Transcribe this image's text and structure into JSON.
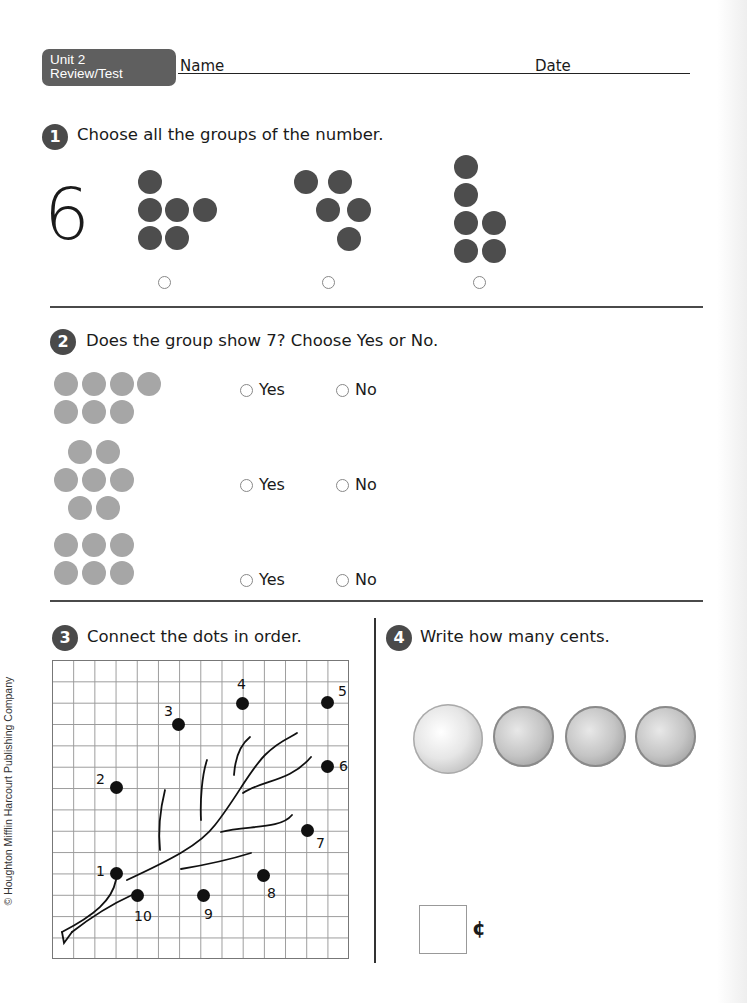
{
  "header": {
    "badge_line1": "Unit 2",
    "badge_line2": "Review/Test",
    "name_label": "Name",
    "date_label": "Date"
  },
  "q1": {
    "number": "1",
    "prompt": "Choose all the groups of the number.",
    "target_number": "6",
    "groups": [
      {
        "dot_count": 6,
        "selected": false
      },
      {
        "dot_count": 5,
        "selected": false
      },
      {
        "dot_count": 6,
        "selected": false
      }
    ]
  },
  "q2": {
    "number": "2",
    "prompt": "Does the group show 7? Choose Yes or No.",
    "yes_label": "Yes",
    "no_label": "No",
    "rows": [
      {
        "dot_count": 7,
        "answer": null
      },
      {
        "dot_count": 7,
        "answer": null
      },
      {
        "dot_count": 6,
        "answer": null
      }
    ]
  },
  "q3": {
    "number": "3",
    "prompt": "Connect the dots in order.",
    "dots": [
      {
        "label": "1"
      },
      {
        "label": "2"
      },
      {
        "label": "3"
      },
      {
        "label": "4"
      },
      {
        "label": "5"
      },
      {
        "label": "6"
      },
      {
        "label": "7"
      },
      {
        "label": "8"
      },
      {
        "label": "9"
      },
      {
        "label": "10"
      }
    ]
  },
  "q4": {
    "number": "4",
    "prompt": "Write how many cents.",
    "coins": [
      {
        "type": "nickel",
        "icon": "nickel-coin-icon"
      },
      {
        "type": "penny",
        "icon": "penny-coin-icon"
      },
      {
        "type": "penny",
        "icon": "penny-coin-icon"
      },
      {
        "type": "penny",
        "icon": "penny-coin-icon"
      }
    ],
    "answer_value": "",
    "cent_symbol": "¢"
  },
  "footer": {
    "copyright": "© Houghton Mifflin Harcourt Publishing Company"
  },
  "colors": {
    "badge": "#5f5f5f",
    "dark_dot": "#4d4d4d",
    "gray_dot": "#a6a6a6",
    "rule": "#4a4a4a"
  }
}
